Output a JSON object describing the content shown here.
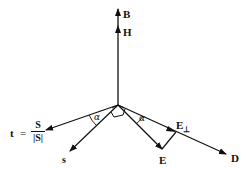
{
  "diagram": {
    "title": "",
    "vectors": [
      {
        "id": "B",
        "label": "B",
        "description": "magnetic flux density, vertical up"
      },
      {
        "id": "H",
        "label": "H",
        "description": "magnetic field, vertical up"
      },
      {
        "id": "t",
        "label": "t",
        "equals": "=",
        "numerator": "S",
        "denominator": "|S|",
        "description": "unit Poynting direction"
      },
      {
        "id": "s",
        "label": "s",
        "description": "wave normal direction"
      },
      {
        "id": "E",
        "label": "E",
        "description": "electric field"
      },
      {
        "id": "D",
        "label": "D",
        "description": "electric displacement"
      },
      {
        "id": "E_perp",
        "label": "E",
        "subscript": "⊥",
        "description": "component of E perpendicular to s along D"
      }
    ],
    "angles": [
      {
        "symbol": "α",
        "between": [
          "t",
          "s"
        ]
      },
      {
        "symbol": "α",
        "between": [
          "E",
          "D"
        ]
      }
    ],
    "colors": {
      "stroke": "#111111",
      "background": "#ffffff"
    }
  }
}
